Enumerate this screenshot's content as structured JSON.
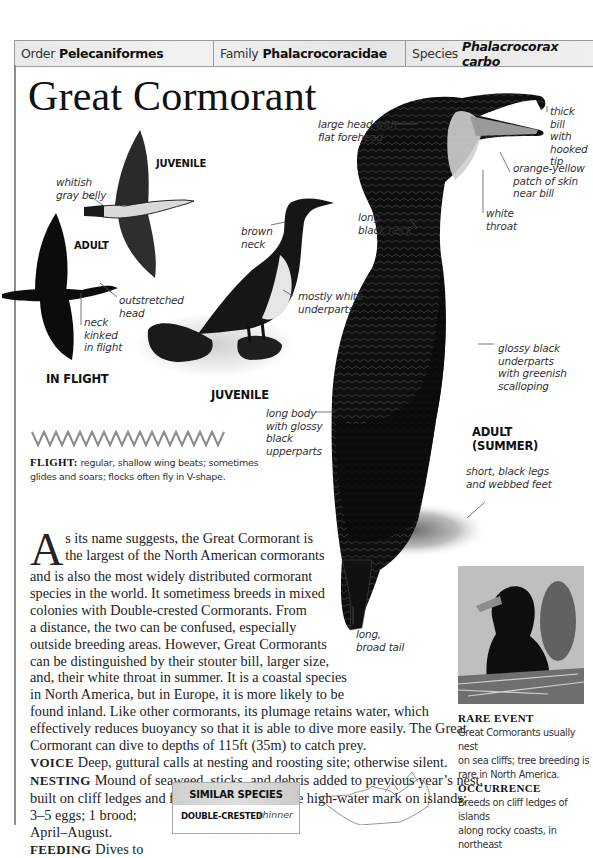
{
  "taxonomy": {
    "order": {
      "key": "Order",
      "value": "Pelecaniformes"
    },
    "family": {
      "key": "Family",
      "value": "Phalacrocoracidae"
    },
    "species": {
      "key": "Species",
      "value": "Phalacrocorax carbo"
    }
  },
  "title": "Great Cormorant",
  "illustration": {
    "tags": {
      "juvenile_flight": "JUVENILE",
      "adult_flight": "ADULT",
      "in_flight": "IN FLIGHT",
      "juvenile_standing": "JUVENILE",
      "adult_summer_1": "ADULT",
      "adult_summer_2": "(SUMMER)"
    },
    "labels": {
      "whitish_gray_belly": [
        "whitish",
        "gray belly"
      ],
      "outstretched_head": [
        "outstretched",
        "head"
      ],
      "neck_kinked": [
        "neck",
        "kinked",
        "in flight"
      ],
      "brown_neck": [
        "brown",
        "neck"
      ],
      "mostly_white_underparts": [
        "mostly white",
        "underparts"
      ],
      "large_head": [
        "large head with",
        "flat forehead"
      ],
      "thick_bill": [
        "thick bill",
        "with",
        "hooked",
        "tip"
      ],
      "orange_yellow_patch": [
        "orange-yellow",
        "patch of skin",
        "near bill"
      ],
      "white_throat": [
        "white",
        "throat"
      ],
      "long_black_neck": [
        "long,",
        "black neck"
      ],
      "glossy_black_underparts": [
        "glossy black",
        "underparts",
        "with greenish",
        "scalloping"
      ],
      "long_body": [
        "long body",
        "with glossy",
        "black",
        "upperparts"
      ],
      "short_black_legs": [
        "short, black legs",
        "and webbed feet"
      ],
      "long_broad_tail": [
        "long,",
        "broad tail"
      ]
    }
  },
  "flight": {
    "label": "FLIGHT:",
    "text": " regular, shallow wing beats; sometimes glides and soars; flocks often fly in V-shape."
  },
  "body": {
    "dropcap": "A",
    "lines": [
      "s its name suggests, the Great Cormorant is",
      "the largest of the North American cormorants",
      "and is also the most widely distributed cormorant",
      "species in the world. It sometimess breeds in mixed",
      "colonies with Double-crested Cormorants. From",
      "a distance, the two can be confused, especially",
      "outside breeding areas. However, Great Cormorants",
      "can be distinguished by their stouter bill, larger size,",
      "and, their white throat in summer. It is a coastal species",
      "in North America, but in Europe, it is more likely to be",
      "found inland. Like other cormorants, its plumage retains water, which",
      "effectively reduces buoyancy so that it is able to dive more easily. The Great",
      "Cormorant can dive to depths of 115ft (35m) to catch prey."
    ],
    "voice": {
      "label": "VOICE",
      "text": "Deep, guttural calls at nesting and roosting site; otherwise silent."
    },
    "nesting": {
      "label": "NESTING",
      "lines": [
        "Mound of seaweed, sticks, and debris added to previous year’s nest,",
        "built on cliff ledges and flat tops of rocks above high-water mark on islands;",
        "3–5 eggs; 1 brood;",
        "April–August."
      ]
    },
    "feeding": {
      "label": "FEEDING",
      "text": "Dives to"
    }
  },
  "similar_species": {
    "heading": "SIMILAR SPECIES",
    "item": "DOUBLE-CRESTED",
    "item_line2": "CORMORANT",
    "note": "thinner"
  },
  "sidebar": {
    "rare_event": {
      "heading": "RARE EVENT",
      "text": [
        "Great Cormorants usually nest",
        "on sea cliffs; tree breeding is",
        "rare in North America."
      ]
    },
    "occurrence": {
      "heading": "OCCURRENCE",
      "text": [
        "Breeds on cliff ledges of islands",
        "along rocky coasts, in northeast"
      ]
    }
  },
  "colors": {
    "header_bg": "#ebebeb",
    "rule": "#9a9a9a",
    "text": "#222222",
    "bird": "#0d0d0d"
  }
}
